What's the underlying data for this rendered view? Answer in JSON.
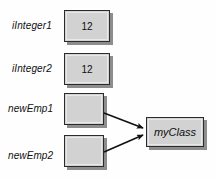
{
  "diagram": {
    "type": "object-reference-diagram",
    "background_color": "#fefefe",
    "box_fill_color": "#d2d2d2",
    "box_border_color": "#2b2b2b",
    "shadow_color": "#8d8d8d",
    "arrow_color": "#111111",
    "variables": [
      {
        "label": "iInteger1",
        "value": "12",
        "kind": "value-box",
        "x": 64,
        "y": 10,
        "w": 46,
        "h": 32,
        "label_x": 12,
        "label_y": 20
      },
      {
        "label": "iInteger2",
        "value": "12",
        "kind": "value-box",
        "x": 64,
        "y": 53,
        "w": 46,
        "h": 32,
        "label_x": 12,
        "label_y": 63
      },
      {
        "label": "newEmp1",
        "value": "",
        "kind": "reference-box",
        "x": 64,
        "y": 93,
        "w": 40,
        "h": 32,
        "label_x": 8,
        "label_y": 103
      },
      {
        "label": "newEmp2",
        "value": "",
        "kind": "reference-box",
        "x": 64,
        "y": 135,
        "w": 40,
        "h": 32,
        "label_x": 8,
        "label_y": 150
      }
    ],
    "object": {
      "label": "myClass",
      "x": 146,
      "y": 117,
      "w": 58,
      "h": 30
    },
    "arrows": [
      {
        "from": "newEmp1",
        "to": "myClass",
        "x1": 104,
        "y1": 113,
        "x2": 144,
        "y2": 128
      },
      {
        "from": "newEmp2",
        "to": "myClass",
        "x1": 104,
        "y1": 152,
        "x2": 144,
        "y2": 134
      }
    ]
  }
}
